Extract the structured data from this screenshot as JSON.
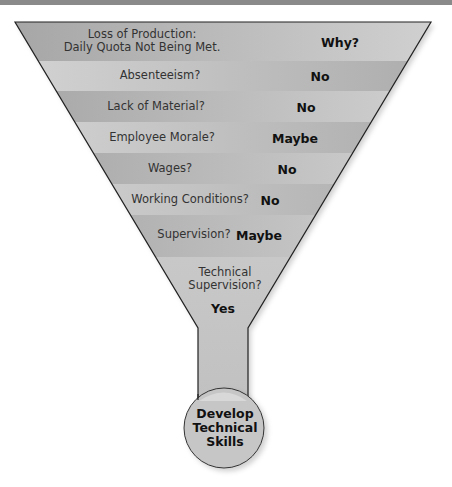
{
  "colors": {
    "band_dark": "#a9a9a9",
    "band_light": "#cdcdcd",
    "outline": "#222222",
    "topbar": "#8a8a8a"
  },
  "funnel": {
    "rows": [
      {
        "question": "Loss of Production:\nDaily Quota Not Being Met.",
        "answer": "Why?"
      },
      {
        "question": "Absenteeism?",
        "answer": "No"
      },
      {
        "question": "Lack of Material?",
        "answer": "No"
      },
      {
        "question": "Employee Morale?",
        "answer": "Maybe"
      },
      {
        "question": "Wages?",
        "answer": "No"
      },
      {
        "question": "Working Conditions?",
        "answer": "No"
      },
      {
        "question": "Supervision?",
        "answer": "Maybe"
      },
      {
        "question": "Technical\nSupervision?",
        "answer": "Yes"
      }
    ],
    "result": "Develop\nTechnical\nSkills"
  }
}
